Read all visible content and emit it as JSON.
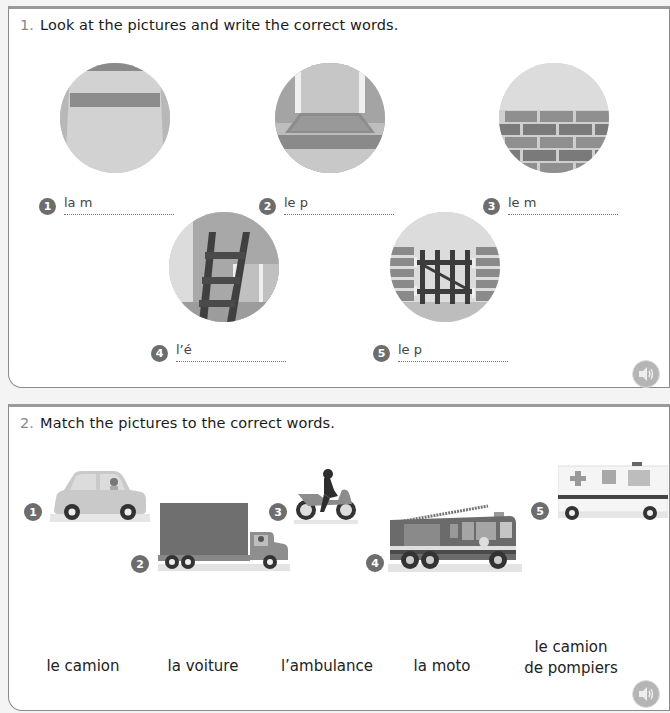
{
  "exercise1": {
    "number": "1.",
    "instruction": "Look at the pictures and write the correct words.",
    "items": [
      {
        "num": "1",
        "prompt": "la m",
        "picture": "ceiling-wall"
      },
      {
        "num": "2",
        "prompt": "le p",
        "picture": "floor-doormat"
      },
      {
        "num": "3",
        "prompt": "le m",
        "picture": "brick-wall"
      },
      {
        "num": "4",
        "prompt": "l’é",
        "picture": "ladder"
      },
      {
        "num": "5",
        "prompt": "le p",
        "picture": "gate"
      }
    ],
    "audio_icon": "speaker-icon"
  },
  "exercise2": {
    "number": "2.",
    "instruction": "Match the pictures to the correct words.",
    "vehicles": [
      {
        "num": "1",
        "picture": "car"
      },
      {
        "num": "2",
        "picture": "truck"
      },
      {
        "num": "3",
        "picture": "motorbike"
      },
      {
        "num": "4",
        "picture": "fire-engine"
      },
      {
        "num": "5",
        "picture": "ambulance"
      }
    ],
    "words": [
      {
        "line1": "le camion",
        "line2": ""
      },
      {
        "line1": "la voiture",
        "line2": ""
      },
      {
        "line1": "l’ambulance",
        "line2": ""
      },
      {
        "line1": "la moto",
        "line2": ""
      },
      {
        "line1": "le camion",
        "line2": "de pompiers"
      }
    ],
    "audio_icon": "speaker-icon"
  }
}
